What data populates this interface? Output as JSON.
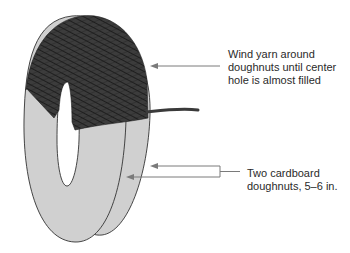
{
  "diagram": {
    "colors": {
      "cardboard_fill": "#d0d0d0",
      "cardboard_stroke": "#333333",
      "yarn_fill": "#3a3a3a",
      "yarn_strand": "#1a1a1a",
      "leader_line": "#7a7a7a",
      "text": "#2a2a2a"
    },
    "labels": [
      {
        "id": "yarn",
        "lines": [
          "Wind yarn around",
          "doughnuts until center",
          "hole is almost filled"
        ]
      },
      {
        "id": "cardboard",
        "lines": [
          "Two cardboard",
          "doughnuts, 5–6 in."
        ]
      }
    ]
  }
}
